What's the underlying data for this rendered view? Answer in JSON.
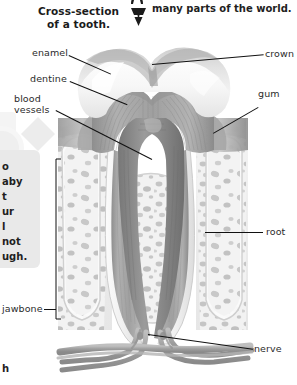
{
  "page": {
    "background_color": "#ffffff",
    "ink_color": "#2b2b2b",
    "panel_color": "#e9e9e9"
  },
  "header": {
    "title_line1": "Cross-section",
    "title_line2": "of a tooth.",
    "icon": "tooth-icon"
  },
  "cut_text": {
    "top_right_line": "many parts of the world.",
    "top_right_icon": "tooth-icon",
    "sidebar_fragments": [
      "o",
      "aby",
      "t",
      "ur",
      "l",
      "not",
      "ugh."
    ],
    "bottom_left_fragment": "h"
  },
  "labels": {
    "left": [
      {
        "id": "enamel",
        "text": "enamel"
      },
      {
        "id": "dentine",
        "text": "dentine"
      },
      {
        "id": "blood-vessels-line1",
        "text": "blood"
      },
      {
        "id": "blood-vessels-line2",
        "text": "vessels"
      },
      {
        "id": "jawbone",
        "text": "jawbone"
      }
    ],
    "right": [
      {
        "id": "crown",
        "text": "crown"
      },
      {
        "id": "gum",
        "text": "gum"
      },
      {
        "id": "root",
        "text": "root"
      },
      {
        "id": "nerve",
        "text": "nerve"
      }
    ]
  },
  "illustration": {
    "name": "tooth-cross-section-diagram",
    "parts": [
      "enamel",
      "dentine",
      "pulp",
      "crown",
      "gum",
      "root",
      "jawbone",
      "nerve",
      "blood-vessels"
    ],
    "colors": {
      "enamel": "#f6f6f6",
      "dentine": "#9a9a9a",
      "pulp": "#7d7d7d",
      "gum": "#b9b9b9",
      "bone": "#f1f1f1",
      "bone_speckle": "#b4b4b4",
      "nerve": "#a8a8a8",
      "outline": "#8d8d8d"
    }
  }
}
